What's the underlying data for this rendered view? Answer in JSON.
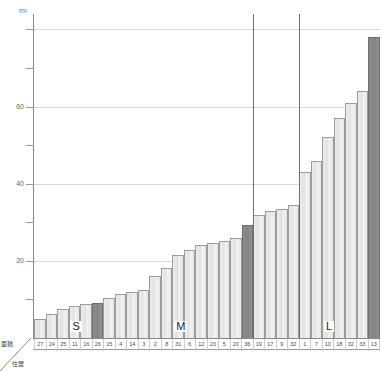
{
  "chart_data": {
    "type": "bar",
    "title": "",
    "subtitle": "",
    "xlabel": "住居",
    "ylabel": "面積",
    "unit_label": "m²",
    "ylim": [
      0,
      84
    ],
    "grid": true,
    "gridlines": [
      20,
      40,
      60,
      80
    ],
    "yticks": [
      10,
      20,
      30,
      40,
      50,
      60,
      70,
      80
    ],
    "ytick_labels_visible": [
      "20",
      "40",
      "60"
    ],
    "legend_position": "none",
    "series_name": "面積",
    "bar_color": "#e8e8e8",
    "bar_border_color": "#9c9c9c",
    "highlight_color": "#8b8b8b",
    "categories": [
      "27",
      "24",
      "25",
      "11",
      "16",
      "26",
      "15",
      "4",
      "14",
      "3",
      "2",
      "8",
      "31",
      "6",
      "12",
      "23",
      "5",
      "20",
      "36",
      "19",
      "17",
      "9",
      "32",
      "1",
      "7",
      "10",
      "18",
      "32",
      "33",
      "13"
    ],
    "values": [
      5.0,
      6.2,
      7.6,
      8.4,
      8.8,
      9.0,
      10.3,
      11.4,
      12.0,
      12.4,
      16.0,
      18.2,
      21.6,
      22.8,
      24.0,
      24.6,
      25.2,
      26.0,
      29.4,
      32.0,
      33.0,
      33.4,
      34.6,
      43.0,
      46.0,
      52.0,
      57.0,
      61.0,
      64.0,
      78.0
    ],
    "highlighted_indices": [
      5,
      18,
      29
    ],
    "group_separators": [
      {
        "after_index": 18
      },
      {
        "after_index": 22
      }
    ],
    "groups": [
      {
        "label": "S",
        "index": 3
      },
      {
        "label": "M",
        "index": 12
      },
      {
        "label": "L",
        "index": 25
      }
    ]
  },
  "axis": {
    "unit": "m²",
    "corner_area_label": "面積",
    "corner_house_label": "住居"
  }
}
